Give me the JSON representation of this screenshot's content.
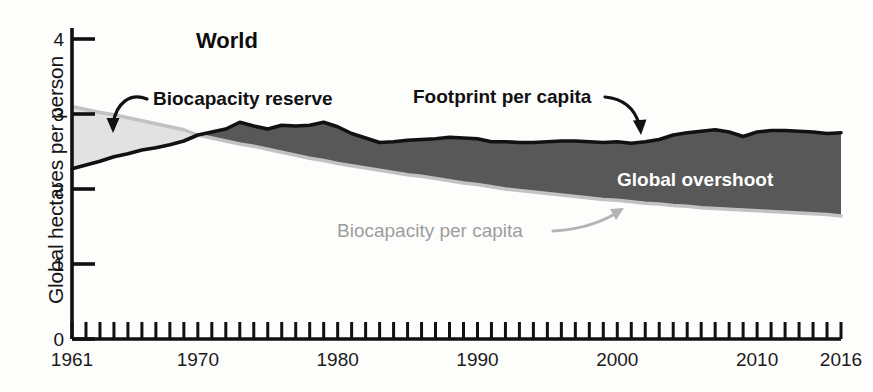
{
  "chart_data": {
    "type": "area",
    "title": "World",
    "xlabel": "",
    "ylabel": "Global hectares per person",
    "xlim": [
      1961,
      2016
    ],
    "ylim": [
      0,
      4
    ],
    "grid": false,
    "legend_position": "inline-annotations",
    "x_ticks_labeled": [
      "1961",
      "1970",
      "1980",
      "1990",
      "2000",
      "2010",
      "2016"
    ],
    "x_tick_values": [
      1961,
      1970,
      1980,
      1990,
      2000,
      2010,
      2016
    ],
    "x_minor_tick_interval": 1,
    "y_ticks": [
      "0",
      "1",
      "2",
      "3",
      "4"
    ],
    "y_tick_values": [
      0,
      1,
      2,
      3,
      4
    ],
    "x": [
      1961,
      1962,
      1963,
      1964,
      1965,
      1966,
      1967,
      1968,
      1969,
      1970,
      1971,
      1972,
      1973,
      1974,
      1975,
      1976,
      1977,
      1978,
      1979,
      1980,
      1981,
      1982,
      1983,
      1984,
      1985,
      1986,
      1987,
      1988,
      1989,
      1990,
      1991,
      1992,
      1993,
      1994,
      1995,
      1996,
      1997,
      1998,
      1999,
      2000,
      2001,
      2002,
      2003,
      2004,
      2005,
      2006,
      2007,
      2008,
      2009,
      2010,
      2011,
      2012,
      2013,
      2014,
      2015,
      2016
    ],
    "series": [
      {
        "name": "Footprint per capita",
        "color": "#555555",
        "values": [
          2.27,
          2.32,
          2.37,
          2.43,
          2.47,
          2.52,
          2.55,
          2.59,
          2.64,
          2.72,
          2.76,
          2.8,
          2.89,
          2.84,
          2.8,
          2.85,
          2.84,
          2.85,
          2.89,
          2.83,
          2.74,
          2.68,
          2.62,
          2.63,
          2.65,
          2.66,
          2.67,
          2.69,
          2.68,
          2.67,
          2.63,
          2.63,
          2.62,
          2.62,
          2.63,
          2.64,
          2.64,
          2.63,
          2.62,
          2.63,
          2.61,
          2.63,
          2.66,
          2.72,
          2.75,
          2.77,
          2.79,
          2.76,
          2.7,
          2.76,
          2.78,
          2.78,
          2.77,
          2.76,
          2.74,
          2.75
        ]
      },
      {
        "name": "Biocapacity per capita",
        "color": "#c9c9c9",
        "values": [
          3.1,
          3.06,
          3.02,
          2.99,
          2.95,
          2.91,
          2.87,
          2.83,
          2.79,
          2.72,
          2.68,
          2.64,
          2.6,
          2.57,
          2.53,
          2.49,
          2.45,
          2.41,
          2.38,
          2.34,
          2.31,
          2.28,
          2.25,
          2.22,
          2.19,
          2.17,
          2.14,
          2.11,
          2.08,
          2.06,
          2.03,
          2.0,
          1.98,
          1.96,
          1.94,
          1.92,
          1.9,
          1.88,
          1.86,
          1.85,
          1.83,
          1.81,
          1.8,
          1.78,
          1.77,
          1.75,
          1.74,
          1.73,
          1.72,
          1.71,
          1.7,
          1.69,
          1.68,
          1.67,
          1.66,
          1.64
        ]
      }
    ],
    "regions": [
      {
        "name": "Biocapacity reserve",
        "fill": "#e2e2e2",
        "from": 1961,
        "to": 1970
      },
      {
        "name": "Global overshoot",
        "fill": "#585858",
        "from": 1970,
        "to": 2016
      }
    ],
    "annotations": [
      {
        "name": "biocapacity-reserve-label",
        "text": "Biocapacity reserve",
        "style": "dark-bold",
        "arrow": true
      },
      {
        "name": "footprint-per-capita-label",
        "text": "Footprint per capita",
        "style": "dark-bold",
        "arrow": true
      },
      {
        "name": "global-overshoot-label",
        "text": "Global overshoot",
        "style": "white-bold",
        "arrow": false
      },
      {
        "name": "biocapacity-per-capita-label",
        "text": "Biocapacity per capita",
        "style": "gray",
        "arrow": true
      }
    ]
  },
  "colors": {
    "axis": "#111111",
    "footprint_line": "#111111",
    "biocapacity_line": "#bdbdbd",
    "reserve_fill": "#e3e3e3",
    "overshoot_fill": "#585858",
    "gray_text": "#9d9d9d",
    "background": "#fdfdfc"
  }
}
